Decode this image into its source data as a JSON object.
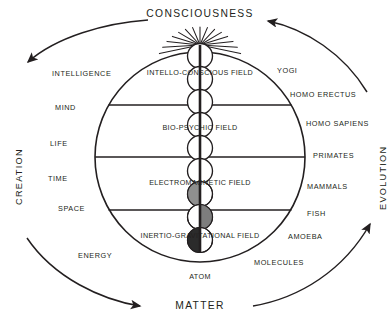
{
  "diagram": {
    "poles": {
      "top": "CONSCIOUSNESS",
      "bottom": "MATTER"
    },
    "axes": {
      "left": "CREATION",
      "right": "EVOLUTION"
    },
    "fields": [
      {
        "label": "INTELLO-CONSCIOUS FIELD"
      },
      {
        "label": "BIO-PSYCHIC FIELD"
      },
      {
        "label": "ELECTROMAGNETIC FIELD"
      },
      {
        "label": "INERTIO-GRAVITATIONAL FIELD"
      }
    ],
    "center_bottom_label": "ATOM",
    "left_labels": [
      {
        "text": "INTELLIGENCE"
      },
      {
        "text": "MIND"
      },
      {
        "text": "LIFE"
      },
      {
        "text": "TIME"
      },
      {
        "text": "SPACE"
      },
      {
        "text": "ENERGY"
      }
    ],
    "right_labels": [
      {
        "text": "YOGI"
      },
      {
        "text": "HOMO ERECTUS"
      },
      {
        "text": "HOMO SAPIENS"
      },
      {
        "text": "PRIMATES"
      },
      {
        "text": "MAMMALS"
      },
      {
        "text": "FISH"
      },
      {
        "text": "AMOEBA"
      },
      {
        "text": "MOLECULES"
      }
    ],
    "colors": {
      "ink": "#231f20",
      "background": "#ffffff",
      "sphere_light": "#ffffff",
      "sphere_mid_gray": "#8b8b8b",
      "sphere_dark_gray": "#6e6e6e",
      "sphere_darkest": "#2b2b2b"
    },
    "arrows": [
      {
        "name": "creation-upper-arc",
        "direction": "down-left"
      },
      {
        "name": "creation-lower-arc",
        "direction": "down-right"
      },
      {
        "name": "evolution-lower-arc",
        "direction": "up-right"
      },
      {
        "name": "evolution-upper-arc",
        "direction": "up-left"
      }
    ]
  }
}
